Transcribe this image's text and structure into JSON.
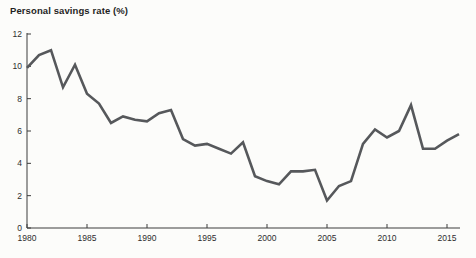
{
  "page": {
    "background": "#fcfcfa"
  },
  "chart_data": {
    "type": "line",
    "title": "Personal savings rate (%)",
    "xlabel": "",
    "ylabel": "",
    "x": [
      1980,
      1981,
      1982,
      1983,
      1984,
      1985,
      1986,
      1987,
      1988,
      1989,
      1990,
      1991,
      1992,
      1993,
      1994,
      1995,
      1996,
      1997,
      1998,
      1999,
      2000,
      2001,
      2002,
      2003,
      2004,
      2005,
      2006,
      2007,
      2008,
      2009,
      2010,
      2011,
      2012,
      2013,
      2014,
      2015,
      2016
    ],
    "series": [
      {
        "name": "Personal savings rate",
        "values": [
          9.9,
          10.7,
          11.0,
          8.7,
          10.1,
          8.3,
          7.7,
          6.5,
          6.9,
          6.7,
          6.6,
          7.1,
          7.3,
          5.5,
          5.1,
          5.2,
          4.9,
          4.6,
          5.3,
          3.2,
          2.9,
          2.7,
          3.5,
          3.5,
          3.6,
          1.7,
          2.6,
          2.9,
          5.2,
          6.1,
          5.6,
          6.0,
          7.6,
          4.9,
          4.9,
          5.4,
          5.8
        ]
      }
    ],
    "xlim": [
      1980,
      2016
    ],
    "ylim": [
      0,
      12
    ],
    "xticks": [
      1980,
      1985,
      1990,
      1995,
      2000,
      2005,
      2010,
      2015
    ],
    "yticks": [
      0,
      2,
      4,
      6,
      8,
      10,
      12
    ],
    "grid": false,
    "legend": "none",
    "line_color": "#56585b",
    "axis_color": "#3c3c3c",
    "tick_label_color": "#2e2e2e"
  }
}
